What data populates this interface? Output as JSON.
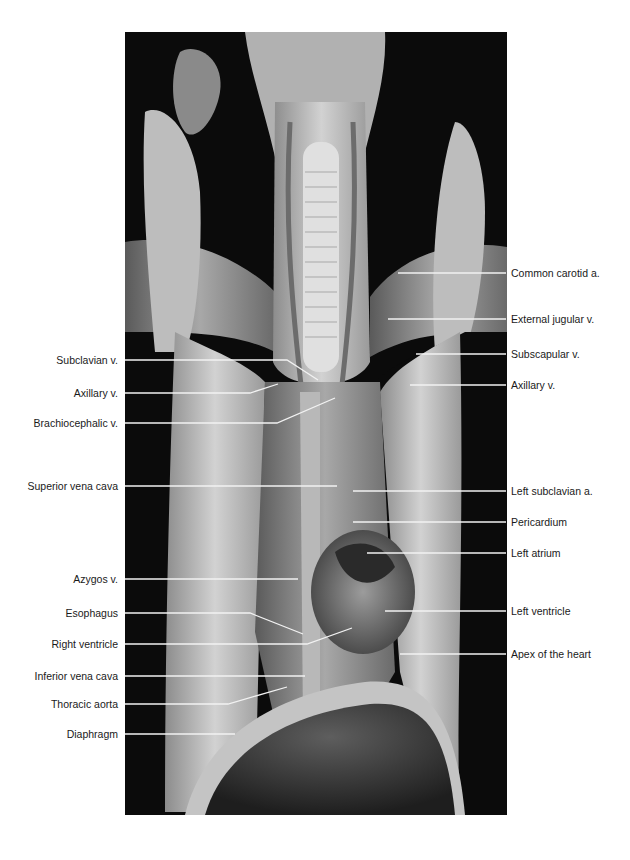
{
  "figure": {
    "background_color": "#0b0b0b",
    "leader_line_color": "#f2f2f2"
  },
  "labels_left": [
    {
      "text": "Subclavian v.",
      "y": 360
    },
    {
      "text": "Axillary v.",
      "y": 393
    },
    {
      "text": "Brachiocephalic v.",
      "y": 423
    },
    {
      "text": "Superior vena cava",
      "y": 486
    },
    {
      "text": "Azygos v.",
      "y": 579
    },
    {
      "text": "Esophagus",
      "y": 613
    },
    {
      "text": "Right ventricle",
      "y": 644
    },
    {
      "text": "Inferior vena cava",
      "y": 676
    },
    {
      "text": "Thoracic aorta",
      "y": 704
    },
    {
      "text": "Diaphragm",
      "y": 734
    }
  ],
  "labels_right": [
    {
      "text": "Common carotid a.",
      "y": 273
    },
    {
      "text": "External jugular v.",
      "y": 319
    },
    {
      "text": "Subscapular v.",
      "y": 354
    },
    {
      "text": "Axillary v.",
      "y": 385
    },
    {
      "text": "Left subclavian a.",
      "y": 491
    },
    {
      "text": "Pericardium",
      "y": 522
    },
    {
      "text": "Left atrium",
      "y": 553
    },
    {
      "text": "Left ventricle",
      "y": 611
    },
    {
      "text": "Apex of the heart",
      "y": 654
    }
  ]
}
